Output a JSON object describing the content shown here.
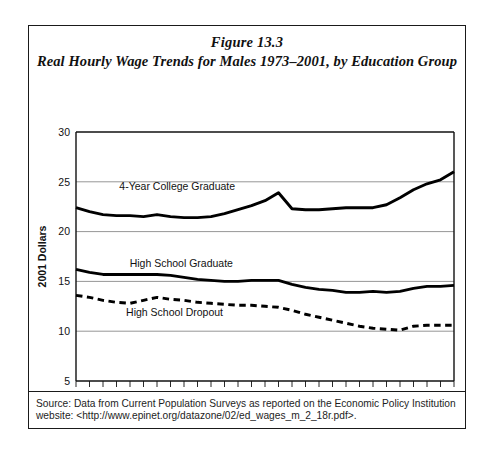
{
  "figure": {
    "number_label": "Figure 13.3",
    "title": "Real Hourly Wage Trends for Males 1973–2001, by Education Group",
    "source_line1": "Source: Data from Current Population Surveys as reported on the Economic Policy Institution",
    "source_line2": "website: <http://www.epinet.org/datazone/02/ed_wages_m_2_18r.pdf>."
  },
  "chart_data": {
    "type": "line",
    "title": "Real Hourly Wage Trends for Males 1973–2001, by Education Group",
    "xlabel": "",
    "ylabel": "2001 Dollars",
    "xlim": [
      1973,
      2001
    ],
    "ylim": [
      5,
      30
    ],
    "yticks": [
      5,
      10,
      15,
      20,
      25,
      30
    ],
    "ytick_labels": [
      "5",
      "10",
      "15",
      "20",
      "25",
      "30"
    ],
    "xticks": [
      1973,
      1974,
      1975,
      1976,
      1977,
      1978,
      1979,
      1980,
      1981,
      1982,
      1983,
      1984,
      1985,
      1986,
      1987,
      1988,
      1989,
      1990,
      1991,
      1992,
      1993,
      1994,
      1995,
      1996,
      1997,
      1998,
      1999,
      2000,
      2001
    ],
    "xtick_labels_shown": [
      "1973",
      "1978",
      "1983",
      "1988",
      "1993",
      "1998",
      "2001"
    ],
    "grid": "horizontal",
    "legend_position": "inline-annotations",
    "x": [
      1973,
      1974,
      1975,
      1976,
      1977,
      1978,
      1979,
      1980,
      1981,
      1982,
      1983,
      1984,
      1985,
      1986,
      1987,
      1988,
      1989,
      1990,
      1991,
      1992,
      1993,
      1994,
      1995,
      1996,
      1997,
      1998,
      1999,
      2000,
      2001
    ],
    "series": [
      {
        "name": "4-Year College Graduate",
        "style": "solid",
        "color": "#000000",
        "values": [
          22.4,
          22.0,
          21.7,
          21.6,
          21.6,
          21.5,
          21.7,
          21.5,
          21.4,
          21.4,
          21.5,
          21.8,
          22.2,
          22.6,
          23.1,
          23.9,
          22.3,
          22.2,
          22.2,
          22.3,
          22.4,
          22.4,
          22.4,
          22.7,
          23.4,
          24.2,
          24.8,
          25.2,
          26.0
        ]
      },
      {
        "name": "High School Graduate",
        "style": "solid",
        "color": "#000000",
        "values": [
          16.2,
          15.9,
          15.7,
          15.7,
          15.7,
          15.7,
          15.7,
          15.6,
          15.4,
          15.2,
          15.1,
          15.0,
          15.0,
          15.1,
          15.1,
          15.1,
          14.7,
          14.4,
          14.2,
          14.1,
          13.9,
          13.9,
          14.0,
          13.9,
          14.0,
          14.3,
          14.5,
          14.5,
          14.6
        ]
      },
      {
        "name": "High School Dropout",
        "style": "dashed",
        "color": "#000000",
        "values": [
          13.6,
          13.4,
          13.1,
          12.9,
          12.8,
          13.1,
          13.4,
          13.2,
          13.1,
          12.9,
          12.8,
          12.7,
          12.6,
          12.6,
          12.5,
          12.4,
          12.1,
          11.7,
          11.4,
          11.1,
          10.8,
          10.5,
          10.3,
          10.2,
          10.1,
          10.5,
          10.6,
          10.6,
          10.6
        ]
      }
    ],
    "annotations": [
      {
        "text": "4-Year College Graduate",
        "x": 1980.5,
        "y": 24.2
      },
      {
        "text": "High School Graduate",
        "x": 1980.8,
        "y": 16.45
      },
      {
        "text": "High School Dropout",
        "x": 1980.3,
        "y": 11.55
      }
    ]
  }
}
